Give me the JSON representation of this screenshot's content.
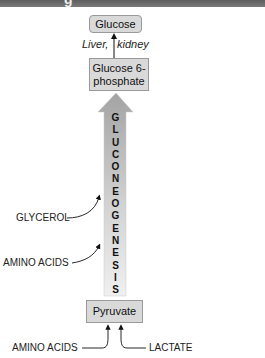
{
  "header": {
    "title_fragment": "g"
  },
  "diagram": {
    "nodes": {
      "glucose": "Glucose",
      "glucose_6_phosphate": "Glucose 6-phosphate",
      "pyruvate": "Pyruvate"
    },
    "organ_label": {
      "left": "Liver,",
      "right": "kidney"
    },
    "process_letters": [
      "G",
      "L",
      "U",
      "C",
      "O",
      "N",
      "E",
      "O",
      "G",
      "E",
      "N",
      "E",
      "S",
      "I",
      "S"
    ],
    "process_name": "GLUCONEOGENESIS",
    "inputs": {
      "glycerol": "GLYCEROL",
      "amino_acids_side": "AMINO ACIDS",
      "amino_acids_bottom": "AMINO ACIDS",
      "lactate": "LACTATE"
    },
    "colors": {
      "box_fill": "#d9d9d9",
      "box_border": "#9a9a9a",
      "arrow_top": "#a8a8a8",
      "arrow_bottom": "#f0f0f0",
      "header": "#6d6d6d"
    }
  }
}
